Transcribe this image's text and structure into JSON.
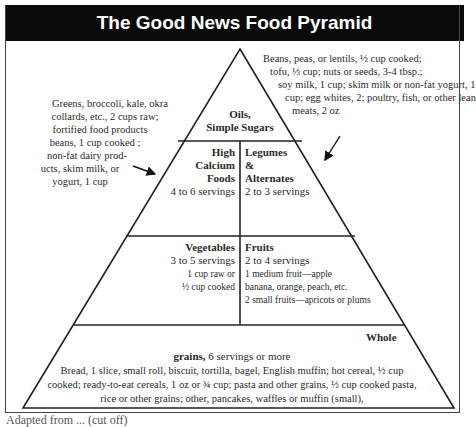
{
  "title": "The Good News Food Pyramid",
  "colors": {
    "title_bg": "#0a0a0a",
    "title_text": "#ffffff",
    "lines": "#222222",
    "text": "#2a2a2a"
  },
  "annotations": {
    "left_note": [
      "Greens, broccoli, kale, okra",
      "collards, etc., 2 cups raw;",
      "fortified food products",
      "beans, 1 cup cooked ;",
      "non-fat dairy prod-",
      "ucts, skim milk, or",
      "yogurt, 1 cup"
    ],
    "right_note": [
      "Beans, peas, or lentils, ½ cup cooked;",
      "tofu, ⅓ cup; nuts or seeds, 3-4 tbsp.;",
      "soy milk, 1 cup; skim milk or non-fat yogurt, 1",
      "cup; egg whites, 2; poultry, fish, or other lean",
      "meats, 2 oz"
    ]
  },
  "tiers": {
    "top": {
      "label_line1": "Oils,",
      "label_line2": "Simple Sugars"
    },
    "calcium": {
      "label_line1": "High",
      "label_line2": "Calcium",
      "label_line3": "Foods",
      "servings": "4 to 6 servings"
    },
    "legumes": {
      "label_line1": "Legumes",
      "label_line2": "&",
      "label_line3": "Alternates",
      "servings": "2 to 3 servings"
    },
    "vegetables": {
      "label": "Vegetables",
      "servings": "3 to 5 servings",
      "detail_line1": "1 cup raw or",
      "detail_line2": "½ cup cooked"
    },
    "fruits": {
      "label": "Fruits",
      "servings": "2 to 4 servings",
      "detail_line1": "1 medium fruit—apple",
      "detail_line2": "banana, orange, peach, etc.",
      "detail_line3": "2 small fruits—apricots or plums"
    },
    "grains": {
      "label_line1": "Whole",
      "label_line2": "grains,",
      "servings": "6 servings or more",
      "detail_line1": "Bread, 1 slice, small roll, biscuit, tortilla, bagel, English muffin; hot cereal, ½ cup",
      "detail_line2": "cooked; ready-to-eat cereals, 1 oz or ¾ cup; pasta and other grains, ½ cup cooked pasta,",
      "detail_line3": "rice or other grains; other, pancakes, waffles or muffin (small),"
    }
  },
  "caption_partial": "Adapted from ... (cut off)"
}
